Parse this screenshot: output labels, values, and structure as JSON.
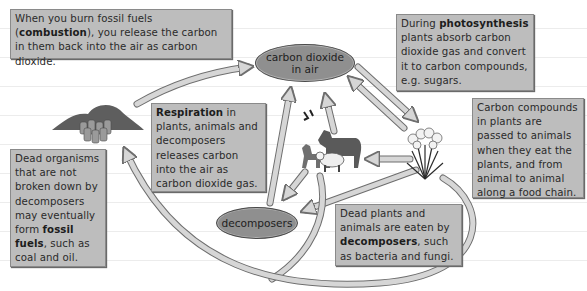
{
  "diagram": {
    "title_visible": "",
    "nodes": {
      "carbon_dioxide": {
        "line1": "carbon dioxide",
        "line2": "in air"
      },
      "decomposers": {
        "label": "decomposers"
      }
    },
    "illustrations": {
      "fossil_fuels": "fossil fuel deposits and oil barrels",
      "animals": "horse, goat, sheep and birds",
      "plants": "flowering plants"
    },
    "boxes": {
      "combustion": {
        "pre": "When you burn fossil fuels (",
        "bold": "combustion",
        "post": "), you release the carbon in them back into the air as carbon dioxide."
      },
      "respiration": {
        "bold": "Respiration",
        "post": " in plants, animals and decomposers releases carbon into the air as carbon dioxide gas."
      },
      "photosynthesis": {
        "pre": "During ",
        "bold": "photosynthesis",
        "post": " plants absorb carbon dioxide gas and convert it to carbon compounds, e.g. sugars."
      },
      "food_chain": {
        "text": "Carbon compounds in plants are passed to animals when they eat the plants, and from animal to animal along a food chain."
      },
      "dead_organisms": {
        "pre": "Dead organisms that are not broken down by decomposers may eventually form ",
        "bold": "fossil fuels",
        "post": ", such as coal and oil."
      },
      "decomposition": {
        "pre": "Dead plants and animals are eaten by ",
        "bold": "decomposers",
        "post": ", such as bacteria and fungi."
      }
    },
    "colors": {
      "box_fill": "#bdbdbd",
      "oval_fill": "#8f8f8f",
      "arrow_fill": "#d6d6d6",
      "arrow_stroke": "#6e6e6e"
    }
  }
}
